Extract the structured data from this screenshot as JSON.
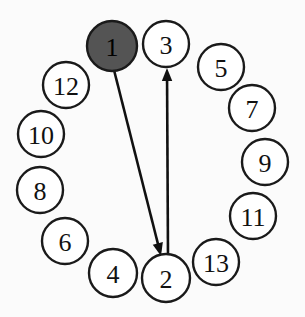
{
  "diagram": {
    "canvas": {
      "width": 305,
      "height": 317,
      "background": "#fbfbfb"
    },
    "style": {
      "node_fill": "#ffffff",
      "node_highlight_fill": "#545454",
      "node_stroke": "#1a1a1a",
      "edge_color": "#111111",
      "label_color": "#111111"
    },
    "nodes": [
      {
        "id": "n1",
        "label": "1",
        "cx": 112,
        "cy": 46,
        "r": 25,
        "highlighted": true
      },
      {
        "id": "n2",
        "label": "2",
        "cx": 166,
        "cy": 278,
        "r": 24,
        "highlighted": false
      },
      {
        "id": "n3",
        "label": "3",
        "cx": 166,
        "cy": 44,
        "r": 23,
        "highlighted": false
      },
      {
        "id": "n4",
        "label": "4",
        "cx": 113,
        "cy": 273,
        "r": 24,
        "highlighted": false
      },
      {
        "id": "n5",
        "label": "5",
        "cx": 221,
        "cy": 67,
        "r": 23,
        "highlighted": false
      },
      {
        "id": "n6",
        "label": "6",
        "cx": 65,
        "cy": 241,
        "r": 23,
        "highlighted": false
      },
      {
        "id": "n7",
        "label": "7",
        "cx": 252,
        "cy": 108,
        "r": 23,
        "highlighted": false
      },
      {
        "id": "n8",
        "label": "8",
        "cx": 40,
        "cy": 190,
        "r": 23,
        "highlighted": false
      },
      {
        "id": "n9",
        "label": "9",
        "cx": 265,
        "cy": 162,
        "r": 23,
        "highlighted": false
      },
      {
        "id": "n10",
        "label": "10",
        "cx": 41,
        "cy": 134,
        "r": 23,
        "highlighted": false
      },
      {
        "id": "n11",
        "label": "11",
        "cx": 253,
        "cy": 216,
        "r": 23,
        "highlighted": false
      },
      {
        "id": "n12",
        "label": "12",
        "cx": 66,
        "cy": 85,
        "r": 23,
        "highlighted": false
      },
      {
        "id": "n13",
        "label": "13",
        "cx": 216,
        "cy": 262,
        "r": 23,
        "highlighted": false
      }
    ],
    "edges": [
      {
        "id": "e1",
        "from": "1",
        "to": "2",
        "x1": 114,
        "y1": 70,
        "x2": 161,
        "y2": 256,
        "directed": true
      },
      {
        "id": "e2",
        "from": "2",
        "to": "3",
        "x1": 168,
        "y1": 256,
        "x2": 167,
        "y2": 68,
        "directed": true
      }
    ]
  }
}
